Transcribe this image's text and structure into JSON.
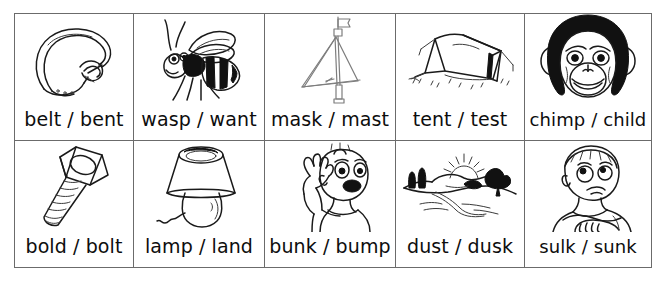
{
  "worksheet": {
    "title": "Minimal pairs picture grid",
    "rows": [
      {
        "cells": [
          {
            "label": "belt / bent",
            "picture": "belt-illustration",
            "icon_name": "belt-icon"
          },
          {
            "label": "wasp / want",
            "picture": "wasp-illustration",
            "icon_name": "wasp-icon"
          },
          {
            "label": "mask / mast",
            "picture": "mast-illustration",
            "icon_name": "mast-icon"
          },
          {
            "label": "tent / test",
            "picture": "tent-illustration",
            "icon_name": "tent-icon"
          },
          {
            "label": "chimp / child",
            "picture": "chimp-illustration",
            "icon_name": "chimp-icon"
          }
        ]
      },
      {
        "cells": [
          {
            "label": "bold / bolt",
            "picture": "bolt-illustration",
            "icon_name": "bolt-icon"
          },
          {
            "label": "lamp / land",
            "picture": "lamp-illustration",
            "icon_name": "lamp-icon"
          },
          {
            "label": "bunk / bump",
            "picture": "bump-illustration",
            "icon_name": "bump-icon"
          },
          {
            "label": "dust / dusk",
            "picture": "dusk-illustration",
            "icon_name": "dusk-icon"
          },
          {
            "label": "sulk / sunk",
            "picture": "sulk-illustration",
            "icon_name": "sulk-icon"
          }
        ]
      }
    ],
    "colors": {
      "ink": "#1a1a1a",
      "border": "#6b6b6b",
      "background": "#ffffff",
      "light_ink": "#7d7d7d"
    }
  }
}
